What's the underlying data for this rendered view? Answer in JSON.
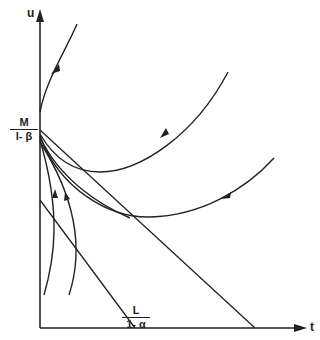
{
  "diagram": {
    "type": "phase-portrait",
    "axes": {
      "vertical_label": "u",
      "horizontal_label": "t"
    },
    "vertical_intercept_label": {
      "numerator": "M",
      "denominator": "l- β"
    },
    "horizontal_intercept_label": {
      "numerator": "L",
      "denominator": "1- α"
    },
    "lines": [
      {
        "name": "upper-isocline",
        "from": [
          40,
          130
        ],
        "to": [
          255,
          328
        ]
      },
      {
        "name": "lower-isocline",
        "from": [
          40,
          200
        ],
        "to": [
          135,
          328
        ]
      }
    ],
    "trajectories": [
      {
        "name": "top-trajectory",
        "direction": "toward node from above"
      },
      {
        "name": "upper-u-trajectory",
        "direction": "toward node from right"
      },
      {
        "name": "lower-u-trajectory",
        "direction": "toward node from right"
      },
      {
        "name": "leaving-trajectory",
        "direction": "from node to lower right"
      },
      {
        "name": "rising-trajectory-1",
        "direction": "upward toward node"
      },
      {
        "name": "rising-trajectory-2",
        "direction": "upward toward node"
      }
    ],
    "stroke_color": "#222222"
  }
}
